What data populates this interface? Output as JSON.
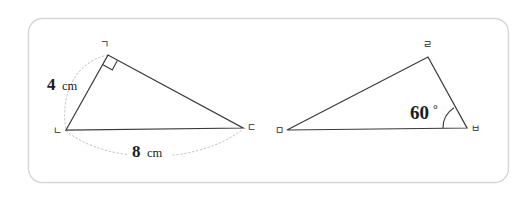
{
  "panel": {
    "background_color": "#ffffff",
    "border_color": "#d6d6d6",
    "corner_radius": 14
  },
  "figure": {
    "caption": "",
    "stroke_color": "#3a3a3a",
    "guide_color": "#c2c2c2",
    "triangles": [
      {
        "id": "triangle-left",
        "name": "right-triangle-gin-nieun-digeut",
        "vertices": [
          {
            "label": "ㄱ",
            "name": "vertex-label-giyeok",
            "x": 108,
            "y": 55
          },
          {
            "label": "ㄴ",
            "name": "vertex-label-nieun",
            "x": 66,
            "y": 130
          },
          {
            "label": "ㄷ",
            "name": "vertex-label-digeut",
            "x": 243,
            "y": 128
          }
        ],
        "right_angle_at": "ㄱ",
        "measurements": [
          {
            "value": "4",
            "unit": "cm",
            "side": "ㄴㄱ",
            "name": "side-length-4cm"
          },
          {
            "value": "8",
            "unit": "cm",
            "side": "ㄴㄷ",
            "name": "side-length-8cm"
          }
        ]
      },
      {
        "id": "triangle-right",
        "name": "triangle-mieum-rieul-bieup",
        "vertices": [
          {
            "label": "ㄹ",
            "name": "vertex-label-rieul",
            "x": 428,
            "y": 57
          },
          {
            "label": "ㅁ",
            "name": "vertex-label-mieum",
            "x": 287,
            "y": 130
          },
          {
            "label": "ㅂ",
            "name": "vertex-label-bieup",
            "x": 467,
            "y": 128
          }
        ],
        "measurements": [
          {
            "value": "60",
            "unit": "°",
            "angle_at": "ㅂ",
            "name": "angle-60-degrees"
          }
        ]
      }
    ]
  },
  "labels": {
    "length_4": "4",
    "length_4_unit": "cm",
    "length_8": "8",
    "length_8_unit": "cm",
    "angle_60": "60",
    "angle_60_unit": "°",
    "vertex_giyeok": "ㄱ",
    "vertex_nieun": "ㄴ",
    "vertex_digeut": "ㄷ",
    "vertex_rieul": "ㄹ",
    "vertex_mieum": "ㅁ",
    "vertex_bieup": "ㅂ"
  }
}
